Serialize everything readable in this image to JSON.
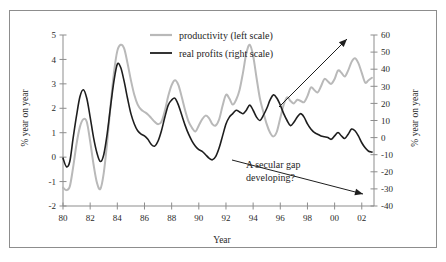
{
  "chart_data": {
    "type": "line",
    "title": "",
    "xlabel": "Year",
    "ylabel": "% year on year",
    "ylabel_right": "% year on year",
    "grid": false,
    "legend_position": "top-center",
    "x": [
      1980.0,
      1980.25,
      1980.5,
      1980.75,
      1981.0,
      1981.25,
      1981.5,
      1981.75,
      1982.0,
      1982.25,
      1982.5,
      1982.75,
      1983.0,
      1983.25,
      1983.5,
      1983.75,
      1984.0,
      1984.25,
      1984.5,
      1984.75,
      1985.0,
      1985.25,
      1985.5,
      1985.75,
      1986.0,
      1986.25,
      1986.5,
      1986.75,
      1987.0,
      1987.25,
      1987.5,
      1987.75,
      1988.0,
      1988.25,
      1988.5,
      1988.75,
      1989.0,
      1989.25,
      1989.5,
      1989.75,
      1990.0,
      1990.25,
      1990.5,
      1990.75,
      1991.0,
      1991.25,
      1991.5,
      1991.75,
      1992.0,
      1992.25,
      1992.5,
      1992.75,
      1993.0,
      1993.25,
      1993.5,
      1993.75,
      1994.0,
      1994.25,
      1994.5,
      1994.75,
      1995.0,
      1995.25,
      1995.5,
      1995.75,
      1996.0,
      1996.25,
      1996.5,
      1996.75,
      1997.0,
      1997.25,
      1997.5,
      1997.75,
      1998.0,
      1998.25,
      1998.5,
      1998.75,
      1999.0,
      1999.25,
      1999.5,
      1999.75,
      2000.0,
      2000.25,
      2000.5,
      2000.75,
      2001.0,
      2001.25,
      2001.5,
      2001.75,
      2002.0,
      2002.25,
      2002.5,
      2002.75
    ],
    "x_axis": {
      "ticks": [
        1980,
        1982,
        1984,
        1986,
        1988,
        1990,
        1992,
        1994,
        1996,
        1998,
        2000,
        2002
      ],
      "tick_labels": [
        "80",
        "82",
        "84",
        "86",
        "88",
        "90",
        "92",
        "94",
        "96",
        "98",
        "00",
        "02"
      ],
      "range": [
        1980,
        2002.9
      ]
    },
    "y_axis_left": {
      "ticks": [
        -2,
        -1,
        0,
        1,
        2,
        3,
        4,
        5
      ],
      "tick_labels": [
        "-2",
        "-1",
        "0",
        "1",
        "2",
        "3",
        "4",
        "5"
      ],
      "range": [
        -2,
        5
      ],
      "label": "% year on year"
    },
    "y_axis_right": {
      "ticks": [
        -40,
        -30,
        -20,
        -10,
        0,
        10,
        20,
        30,
        40,
        50,
        60
      ],
      "tick_labels": [
        "-40",
        "-30",
        "-20",
        "-10",
        "0",
        "10",
        "20",
        "30",
        "40",
        "50",
        "60"
      ],
      "range": [
        -40,
        60
      ],
      "label": "% year on year"
    },
    "series": [
      {
        "name": "productivity (left scale)",
        "axis": "left",
        "color": "#b9b9b9",
        "width": 2.0,
        "values": [
          -1.25,
          -1.35,
          -1.2,
          -0.4,
          0.55,
          1.25,
          1.55,
          1.45,
          0.65,
          -0.3,
          -1.05,
          -1.3,
          -0.65,
          0.6,
          2.1,
          3.45,
          4.35,
          4.6,
          4.45,
          3.85,
          3.15,
          2.55,
          2.15,
          1.95,
          1.85,
          1.75,
          1.6,
          1.45,
          1.35,
          1.45,
          1.9,
          2.5,
          2.95,
          3.15,
          2.95,
          2.45,
          1.9,
          1.45,
          1.2,
          1.05,
          1.3,
          1.55,
          1.7,
          1.6,
          1.35,
          1.3,
          1.55,
          2.1,
          2.55,
          2.4,
          2.15,
          2.35,
          2.75,
          3.45,
          4.25,
          4.6,
          4.15,
          3.25,
          2.4,
          1.85,
          1.35,
          1.0,
          0.85,
          1.05,
          1.6,
          2.15,
          2.45,
          2.3,
          2.2,
          2.35,
          2.3,
          2.25,
          2.5,
          2.85,
          2.75,
          2.65,
          2.9,
          3.2,
          3.1,
          3.0,
          3.2,
          3.55,
          3.45,
          3.3,
          3.55,
          3.9,
          4.05,
          3.85,
          3.45,
          3.05,
          3.15,
          3.25
        ]
      },
      {
        "name": "real profits (right scale)",
        "axis": "right",
        "color": "#1e1e1e",
        "width": 1.6,
        "values": [
          -12.0,
          -17.0,
          -14.0,
          0.0,
          13.0,
          24.0,
          28.0,
          23.0,
          12.0,
          0.0,
          -9.0,
          -14.0,
          -10.0,
          2.0,
          18.0,
          33.0,
          43.0,
          41.0,
          33.0,
          23.0,
          14.0,
          8.0,
          4.0,
          2.0,
          1.0,
          -1.0,
          -4.0,
          -5.0,
          -2.0,
          4.0,
          12.0,
          19.0,
          22.0,
          23.0,
          19.0,
          13.0,
          7.0,
          2.0,
          -2.0,
          -5.0,
          -7.0,
          -8.0,
          -10.0,
          -12.0,
          -13.0,
          -11.0,
          -6.0,
          1.0,
          8.0,
          12.0,
          14.0,
          16.0,
          15.0,
          14.0,
          16.0,
          19.0,
          16.0,
          12.0,
          10.0,
          13.0,
          17.0,
          22.0,
          25.0,
          23.0,
          19.0,
          14.0,
          10.0,
          7.0,
          9.0,
          12.0,
          14.0,
          12.0,
          8.0,
          5.0,
          3.0,
          2.0,
          1.0,
          0.5,
          0.0,
          -1.0,
          1.0,
          3.0,
          1.0,
          -0.5,
          2.0,
          5.0,
          4.0,
          1.0,
          -3.0,
          -6.0,
          -8.0,
          -8.5
        ]
      }
    ],
    "annotations": [
      {
        "id": "secular-gap",
        "text_lines": [
          "A secular gap",
          "developing?"
        ],
        "text_x": 246,
        "text_y": 168,
        "arrow_from": [
          232,
          160
        ],
        "arrow_to": [
          363,
          194
        ]
      },
      {
        "id": "up-arrow",
        "text_lines": [],
        "arrow_from": [
          279,
          107
        ],
        "arrow_to": [
          347,
          39
        ]
      }
    ]
  },
  "legend": {
    "entries": [
      {
        "label": "productivity (left scale)",
        "color": "#b9b9b9"
      },
      {
        "label": "real profits (right scale)",
        "color": "#1e1e1e"
      }
    ]
  },
  "colors": {
    "productivity": "#b9b9b9",
    "real_profits": "#1e1e1e",
    "axis": "#8d8d8d",
    "frame": "#8d8d8d",
    "text": "#1e1e1e",
    "background": "#ffffff"
  }
}
